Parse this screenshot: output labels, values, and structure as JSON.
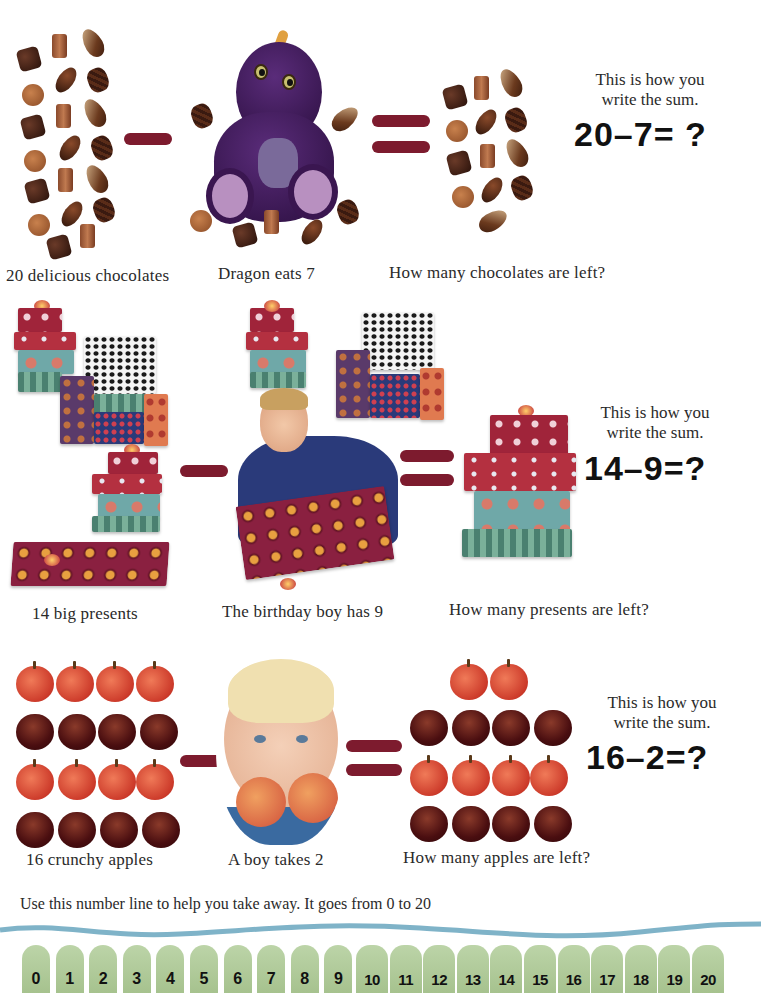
{
  "colors": {
    "operator": "#7d1b2e",
    "number_line_wave": "#7fb3c8",
    "number_tab": "#b3cd9c",
    "text": "#2a2a2a"
  },
  "sections": [
    {
      "id": "chocolates",
      "start_caption": "20 delicious chocolates",
      "take_caption": "Dragon eats 7",
      "result_caption": "How many chocolates are left?",
      "hint": "This is how you write the sum.",
      "hint_line1": "This is how you",
      "hint_line2": "write the sum.",
      "sum": "20–7= ?",
      "start_count": 20,
      "take_count": 7,
      "operator_minus": "minus",
      "operator_equals": "equals"
    },
    {
      "id": "presents",
      "start_caption": "14 big presents",
      "take_caption": "The birthday boy has 9",
      "result_caption": "How many presents are left?",
      "hint_line1": "This is how you",
      "hint_line2": "write the sum.",
      "sum": "14–9=?",
      "start_count": 14,
      "take_count": 9
    },
    {
      "id": "apples",
      "start_caption": "16 crunchy apples",
      "take_caption": "A boy takes 2",
      "result_caption": "How many apples are left?",
      "hint_line1": "This is how you",
      "hint_line2": "write the sum.",
      "sum": "16–2=?",
      "start_count": 16,
      "take_count": 2
    }
  ],
  "number_line": {
    "intro": "Use this number line to help you take away. It goes from 0 to 20",
    "numbers": [
      "0",
      "1",
      "2",
      "3",
      "4",
      "5",
      "6",
      "7",
      "8",
      "9",
      "10",
      "11",
      "12",
      "13",
      "14",
      "15",
      "16",
      "17",
      "18",
      "19",
      "20"
    ]
  }
}
